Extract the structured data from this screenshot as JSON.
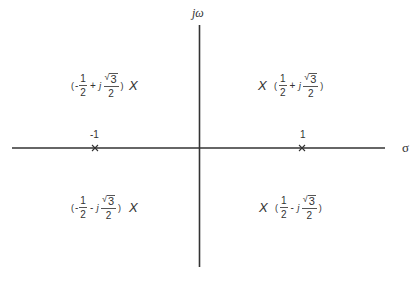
{
  "diagram": {
    "axes": {
      "vertical_label": "jω",
      "horizontal_label": "σ"
    },
    "ticks": [
      {
        "label": "-1",
        "value": -1
      },
      {
        "label": "1",
        "value": 1
      }
    ],
    "pole_marker": "X",
    "poles": [
      {
        "quadrant": "upper-left",
        "open": "(",
        "sign_re": "-",
        "re_num": "1",
        "re_den": "2",
        "op": "+",
        "j": "j",
        "im_rad": "√",
        "im_num": "3",
        "im_den": "2",
        "close": ")",
        "marker": "X"
      },
      {
        "quadrant": "upper-right",
        "open": "(",
        "sign_re": "",
        "re_num": "1",
        "re_den": "2",
        "op": "+",
        "j": "j",
        "im_rad": "√",
        "im_num": "3",
        "im_den": "2",
        "close": ")",
        "marker": "X"
      },
      {
        "quadrant": "lower-left",
        "open": "(",
        "sign_re": "-",
        "re_num": "1",
        "re_den": "2",
        "op": "-",
        "j": "j",
        "im_rad": "√",
        "im_num": "3",
        "im_den": "2",
        "close": ")",
        "marker": "X"
      },
      {
        "quadrant": "lower-right",
        "open": "(",
        "sign_re": "",
        "re_num": "1",
        "re_den": "2",
        "op": "-",
        "j": "j",
        "im_rad": "√",
        "im_num": "3",
        "im_den": "2",
        "close": ")",
        "marker": "X"
      }
    ],
    "real_axis_marks": [
      {
        "label": "-1",
        "marker": "×"
      },
      {
        "label": "1",
        "marker": "×"
      }
    ],
    "colors": {
      "axis": "#333333",
      "text": "#333333",
      "background": "#ffffff"
    }
  }
}
